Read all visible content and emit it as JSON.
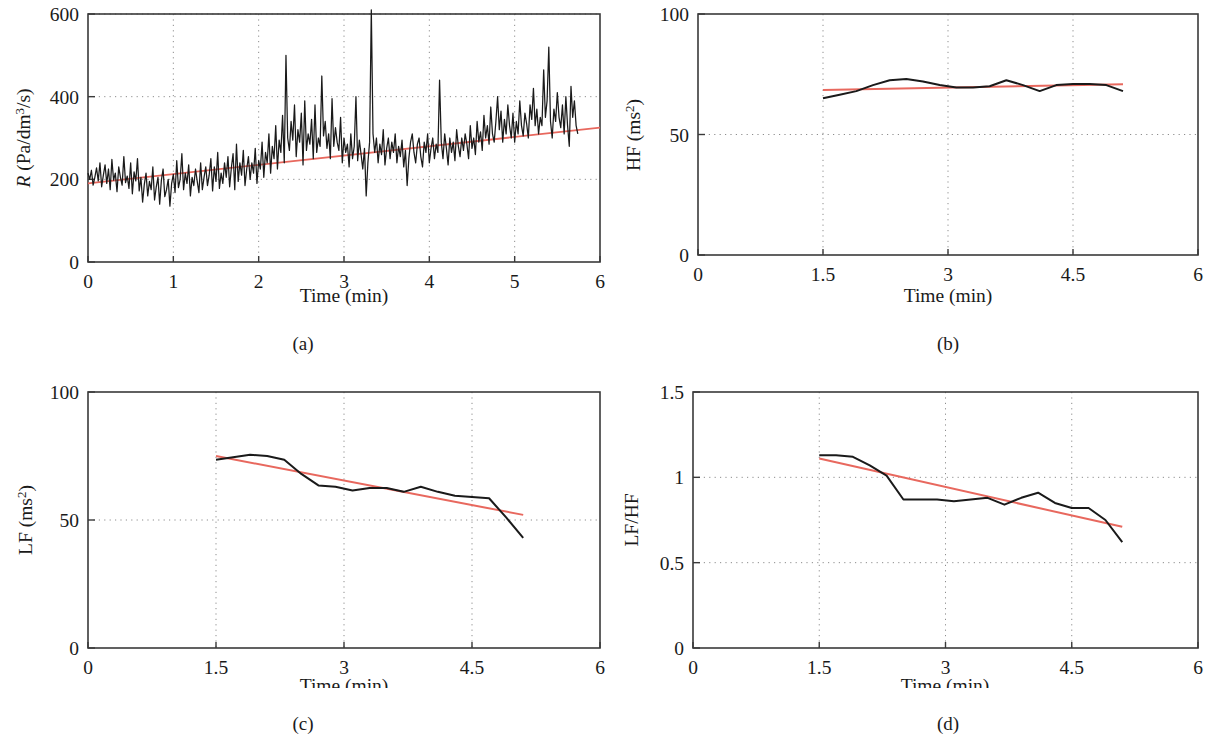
{
  "figure": {
    "background": "#ffffff",
    "trend_color": "#e8685e",
    "data_color": "#1a1a1a",
    "axis_color": "#3a3a3a",
    "grid_color": "#9a9a9a"
  },
  "panels": [
    {
      "id": "a",
      "caption": "(a)",
      "ylabel_main": "R",
      "ylabel_rest": " (Pa/dm",
      "ylabel_sup": "3",
      "ylabel_tail": "/s)",
      "xlabel": "Time (min)",
      "yticks": [
        "0",
        "200",
        "400",
        "600"
      ],
      "xticks": [
        "0",
        "1",
        "2",
        "3",
        "4",
        "5",
        "6"
      ]
    },
    {
      "id": "b",
      "caption": "(b)",
      "ylabel_main": "HF (ms",
      "ylabel_sup": "2",
      "ylabel_tail": ")",
      "xlabel": "Time (min)",
      "yticks": [
        "0",
        "50",
        "100"
      ],
      "xticks": [
        "0",
        "1.5",
        "3",
        "4.5",
        "6"
      ]
    },
    {
      "id": "c",
      "caption": "(c)",
      "ylabel_main": "LF (ms",
      "ylabel_sup": "2",
      "ylabel_tail": ")",
      "xlabel": "Time (min)",
      "yticks": [
        "0",
        "50",
        "100"
      ],
      "xticks": [
        "0",
        "1.5",
        "3",
        "4.5",
        "6"
      ]
    },
    {
      "id": "d",
      "caption": "(d)",
      "ylabel_main": "LF/HF",
      "ylabel_sup": "",
      "ylabel_tail": "",
      "xlabel": "Time (min)",
      "yticks": [
        "0",
        "0.5",
        "1",
        "1.5"
      ],
      "xticks": [
        "0",
        "1.5",
        "3",
        "4.5",
        "6"
      ]
    }
  ],
  "chart_data": [
    {
      "type": "line",
      "panel": "a",
      "title": "",
      "xlabel": "Time (min)",
      "ylabel": "R (Pa/dm3/s)",
      "xlim": [
        0,
        6
      ],
      "ylim": [
        0,
        600
      ],
      "xticks": [
        0,
        1,
        2,
        3,
        4,
        5,
        6
      ],
      "yticks": [
        0,
        200,
        400,
        600
      ],
      "grid": true,
      "legend": "none",
      "series": [
        {
          "name": "R signal",
          "color": "#1a1a1a",
          "x": [
            0.0,
            0.02,
            0.04,
            0.06,
            0.08,
            0.1,
            0.12,
            0.14,
            0.16,
            0.18,
            0.2,
            0.22,
            0.24,
            0.26,
            0.28,
            0.3,
            0.32,
            0.34,
            0.36,
            0.38,
            0.4,
            0.42,
            0.44,
            0.46,
            0.48,
            0.5,
            0.52,
            0.54,
            0.56,
            0.58,
            0.6,
            0.62,
            0.64,
            0.66,
            0.68,
            0.7,
            0.72,
            0.74,
            0.76,
            0.78,
            0.8,
            0.82,
            0.84,
            0.86,
            0.88,
            0.9,
            0.92,
            0.94,
            0.96,
            0.98,
            1.0,
            1.02,
            1.04,
            1.06,
            1.08,
            1.1,
            1.12,
            1.14,
            1.16,
            1.18,
            1.2,
            1.22,
            1.24,
            1.26,
            1.28,
            1.3,
            1.32,
            1.34,
            1.36,
            1.38,
            1.4,
            1.42,
            1.44,
            1.46,
            1.48,
            1.5,
            1.52,
            1.54,
            1.56,
            1.58,
            1.6,
            1.62,
            1.64,
            1.66,
            1.68,
            1.7,
            1.72,
            1.74,
            1.76,
            1.78,
            1.8,
            1.82,
            1.84,
            1.86,
            1.88,
            1.9,
            1.92,
            1.94,
            1.96,
            1.98,
            2.0,
            2.02,
            2.04,
            2.06,
            2.08,
            2.1,
            2.12,
            2.14,
            2.16,
            2.18,
            2.2,
            2.22,
            2.24,
            2.26,
            2.28,
            2.3,
            2.32,
            2.34,
            2.36,
            2.38,
            2.4,
            2.42,
            2.44,
            2.46,
            2.48,
            2.5,
            2.52,
            2.54,
            2.56,
            2.58,
            2.6,
            2.62,
            2.64,
            2.66,
            2.68,
            2.7,
            2.72,
            2.74,
            2.76,
            2.78,
            2.8,
            2.82,
            2.84,
            2.86,
            2.88,
            2.9,
            2.92,
            2.94,
            2.96,
            2.98,
            3.0,
            3.02,
            3.04,
            3.06,
            3.08,
            3.1,
            3.12,
            3.14,
            3.16,
            3.18,
            3.2,
            3.22,
            3.24,
            3.26,
            3.28,
            3.3,
            3.32,
            3.34,
            3.36,
            3.38,
            3.4,
            3.42,
            3.44,
            3.46,
            3.48,
            3.5,
            3.52,
            3.54,
            3.56,
            3.58,
            3.6,
            3.62,
            3.64,
            3.66,
            3.68,
            3.7,
            3.72,
            3.74,
            3.76,
            3.78,
            3.8,
            3.82,
            3.84,
            3.86,
            3.88,
            3.9,
            3.92,
            3.94,
            3.96,
            3.98,
            4.0,
            4.02,
            4.04,
            4.06,
            4.08,
            4.1,
            4.12,
            4.14,
            4.16,
            4.18,
            4.2,
            4.22,
            4.24,
            4.26,
            4.28,
            4.3,
            4.32,
            4.34,
            4.36,
            4.38,
            4.4,
            4.42,
            4.44,
            4.46,
            4.48,
            4.5,
            4.52,
            4.54,
            4.56,
            4.58,
            4.6,
            4.62,
            4.64,
            4.66,
            4.68,
            4.7,
            4.72,
            4.74,
            4.76,
            4.78,
            4.8,
            4.82,
            4.84,
            4.86,
            4.88,
            4.9,
            4.92,
            4.94,
            4.96,
            4.98,
            5.0,
            5.02,
            5.04,
            5.06,
            5.08,
            5.1,
            5.12,
            5.14,
            5.16,
            5.18,
            5.2,
            5.22,
            5.24,
            5.26,
            5.28,
            5.3,
            5.32,
            5.34,
            5.36,
            5.38,
            5.4,
            5.42,
            5.44,
            5.46,
            5.48,
            5.5,
            5.52,
            5.54,
            5.56,
            5.58,
            5.6,
            5.62,
            5.64,
            5.66,
            5.68,
            5.7,
            5.72,
            5.74,
            5.76,
            5.78,
            5.8,
            5.82,
            5.84,
            5.86,
            5.88,
            5.9,
            5.92,
            5.94,
            5.96,
            5.98,
            6.0
          ],
          "y": [
            215,
            200,
            222,
            186,
            205,
            228,
            196,
            240,
            182,
            210,
            235,
            190,
            225,
            175,
            248,
            198,
            215,
            170,
            230,
            205,
            186,
            255,
            192,
            208,
            178,
            240,
            165,
            218,
            196,
            250,
            172,
            205,
            145,
            188,
            215,
            160,
            195,
            175,
            230,
            150,
            182,
            205,
            140,
            198,
            225,
            158,
            175,
            200,
            135,
            190,
            212,
            168,
            245,
            180,
            200,
            262,
            175,
            215,
            190,
            235,
            160,
            205,
            185,
            225,
            195,
            168,
            240,
            175,
            205,
            230,
            185,
            210,
            250,
            172,
            230,
            195,
            265,
            178,
            215,
            190,
            240,
            205,
            255,
            182,
            228,
            262,
            175,
            285,
            195,
            240,
            210,
            270,
            185,
            225,
            255,
            200,
            240,
            215,
            275,
            190,
            245,
            225,
            290,
            205,
            265,
            240,
            310,
            215,
            280,
            250,
            330,
            225,
            295,
            265,
            355,
            240,
            500,
            300,
            270,
            340,
            295,
            380,
            255,
            320,
            290,
            360,
            235,
            390,
            270,
            310,
            285,
            345,
            250,
            380,
            265,
            300,
            280,
            450,
            305,
            340,
            275,
            310,
            250,
            395,
            280,
            325,
            290,
            270,
            350,
            240,
            300,
            265,
            285,
            230,
            310,
            250,
            280,
            400,
            245,
            295,
            260,
            225,
            275,
            160,
            240,
            290,
            610,
            310,
            265,
            300,
            240,
            285,
            260,
            320,
            235,
            275,
            300,
            250,
            290,
            265,
            310,
            240,
            280,
            255,
            295,
            230,
            270,
            185,
            250,
            290,
            310,
            265,
            240,
            285,
            300,
            255,
            230,
            290,
            265,
            310,
            240,
            275,
            300,
            250,
            285,
            265,
            440,
            290,
            250,
            310,
            275,
            235,
            300,
            265,
            290,
            245,
            320,
            280,
            255,
            300,
            270,
            310,
            285,
            250,
            330,
            275,
            300,
            260,
            340,
            290,
            315,
            270,
            355,
            300,
            330,
            285,
            375,
            310,
            290,
            340,
            400,
            320,
            365,
            290,
            345,
            310,
            380,
            330,
            300,
            360,
            290,
            340,
            310,
            390,
            330,
            305,
            360,
            335,
            300,
            380,
            345,
            420,
            330,
            370,
            310,
            350,
            330,
            465,
            350,
            390,
            520,
            340,
            300,
            370,
            340,
            410,
            350,
            325,
            380,
            310,
            400,
            330,
            280,
            425,
            350,
            390,
            330,
            310
          ]
        },
        {
          "name": "R trend line",
          "color": "#e8685e",
          "type": "trend",
          "x": [
            0,
            6
          ],
          "y": [
            190,
            325
          ]
        }
      ]
    },
    {
      "type": "line",
      "panel": "b",
      "title": "",
      "xlabel": "Time (min)",
      "ylabel": "HF (ms2)",
      "xlim": [
        0,
        6
      ],
      "ylim": [
        0,
        100
      ],
      "xticks": [
        0,
        1.5,
        3,
        4.5,
        6
      ],
      "yticks": [
        0,
        50,
        100
      ],
      "grid": true,
      "legend": "none",
      "series": [
        {
          "name": "HF",
          "color": "#1a1a1a",
          "x": [
            1.5,
            1.7,
            1.9,
            2.1,
            2.3,
            2.5,
            2.7,
            2.9,
            3.1,
            3.3,
            3.5,
            3.7,
            3.9,
            4.1,
            4.3,
            4.5,
            4.7,
            4.9,
            5.1
          ],
          "y": [
            65.0,
            66.5,
            68.0,
            70.5,
            72.5,
            73.0,
            72.0,
            70.5,
            69.5,
            69.5,
            70.0,
            72.5,
            70.5,
            68.0,
            70.5,
            71.0,
            71.0,
            70.5,
            68.0
          ]
        },
        {
          "name": "HF trend line",
          "color": "#e8685e",
          "type": "trend",
          "x": [
            1.5,
            5.1
          ],
          "y": [
            68.5,
            70.8
          ]
        }
      ]
    },
    {
      "type": "line",
      "panel": "c",
      "title": "",
      "xlabel": "Time (min)",
      "ylabel": "LF (ms2)",
      "xlim": [
        0,
        6
      ],
      "ylim": [
        0,
        100
      ],
      "xticks": [
        0,
        1.5,
        3,
        4.5,
        6
      ],
      "yticks": [
        0,
        50,
        100
      ],
      "grid": true,
      "legend": "none",
      "series": [
        {
          "name": "LF",
          "color": "#1a1a1a",
          "x": [
            1.5,
            1.7,
            1.9,
            2.1,
            2.3,
            2.5,
            2.7,
            2.9,
            3.1,
            3.3,
            3.5,
            3.7,
            3.9,
            4.1,
            4.3,
            4.5,
            4.7,
            4.9,
            5.1
          ],
          "y": [
            73.5,
            74.5,
            75.5,
            75.0,
            73.5,
            68.0,
            63.5,
            63.0,
            61.5,
            62.5,
            62.5,
            61.0,
            63.0,
            61.0,
            59.5,
            59.0,
            58.5,
            51.0,
            43.0
          ]
        },
        {
          "name": "LF trend line",
          "color": "#e8685e",
          "type": "trend",
          "x": [
            1.5,
            5.1
          ],
          "y": [
            75.0,
            52.0
          ]
        }
      ]
    },
    {
      "type": "line",
      "panel": "d",
      "title": "",
      "xlabel": "Time (min)",
      "ylabel": "LF/HF",
      "xlim": [
        0,
        6
      ],
      "ylim": [
        0,
        1.5
      ],
      "xticks": [
        0,
        1.5,
        3,
        4.5,
        6
      ],
      "yticks": [
        0,
        0.5,
        1,
        1.5
      ],
      "grid": true,
      "legend": "none",
      "series": [
        {
          "name": "LF/HF",
          "color": "#1a1a1a",
          "x": [
            1.5,
            1.7,
            1.9,
            2.1,
            2.3,
            2.5,
            2.7,
            2.9,
            3.1,
            3.3,
            3.5,
            3.7,
            3.9,
            4.1,
            4.3,
            4.5,
            4.7,
            4.9,
            5.1
          ],
          "y": [
            1.13,
            1.13,
            1.12,
            1.07,
            1.01,
            0.87,
            0.87,
            0.87,
            0.86,
            0.87,
            0.88,
            0.84,
            0.88,
            0.91,
            0.85,
            0.82,
            0.82,
            0.75,
            0.62
          ]
        },
        {
          "name": "LF/HF trend line",
          "color": "#e8685e",
          "type": "trend",
          "x": [
            1.5,
            5.1
          ],
          "y": [
            1.11,
            0.71
          ]
        }
      ]
    }
  ]
}
